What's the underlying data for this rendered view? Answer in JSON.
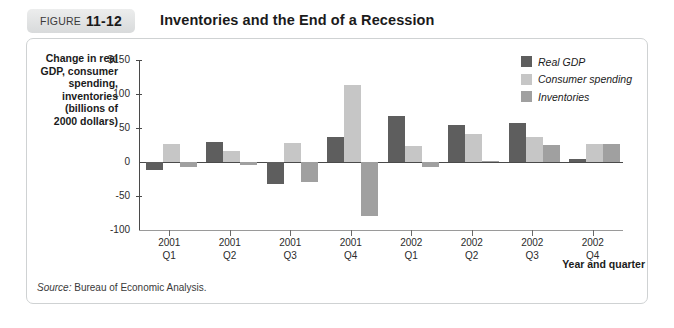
{
  "figure": {
    "tab_word": "FIGURE",
    "tab_number": "11-12",
    "title": "Inventories and the End of a Recession",
    "source_label": "Source:",
    "source_text": " Bureau of Economic Analysis."
  },
  "legend": {
    "items": [
      {
        "label": "Real GDP",
        "color": "#5e5e5e"
      },
      {
        "label": "Consumer spending",
        "color": "#c6c6c6"
      },
      {
        "label": "Inventories",
        "color": "#a0a0a0"
      }
    ]
  },
  "axes": {
    "y_caption": "Change in real GDP, consumer spending, inventories (billions of 2000 dollars)",
    "y_caption_lines": [
      "Change in real",
      "GDP, consumer",
      "spending,",
      "inventories",
      "(billions of",
      "2000 dollars)"
    ],
    "y_ticks": [
      "$150",
      "100",
      "50",
      "0",
      "-50",
      "-100"
    ],
    "x_title": "Year and quarter"
  },
  "chart_data": {
    "type": "bar",
    "title": "Inventories and the End of a Recession",
    "xlabel": "Year and quarter",
    "ylabel": "Change in real GDP, consumer spending, inventories (billions of 2000 dollars)",
    "ylim": [
      -100,
      150
    ],
    "ytick_values": [
      150,
      100,
      50,
      0,
      -50,
      -100
    ],
    "grid": false,
    "legend_position": "top-right",
    "categories": [
      "2001 Q1",
      "2001 Q2",
      "2001 Q3",
      "2001 Q4",
      "2002 Q1",
      "2002 Q2",
      "2002 Q3",
      "2002 Q4"
    ],
    "category_lines": [
      [
        "2001",
        "Q1"
      ],
      [
        "2001",
        "Q2"
      ],
      [
        "2001",
        "Q3"
      ],
      [
        "2001",
        "Q4"
      ],
      [
        "2002",
        "Q1"
      ],
      [
        "2002",
        "Q2"
      ],
      [
        "2002",
        "Q3"
      ],
      [
        "2002",
        "Q4"
      ]
    ],
    "series": [
      {
        "name": "Real GDP",
        "color": "#5e5e5e",
        "values": [
          -12,
          29,
          -32,
          37,
          67,
          54,
          58,
          5
        ]
      },
      {
        "name": "Consumer spending",
        "color": "#c6c6c6",
        "values": [
          27,
          16,
          28,
          113,
          23,
          41,
          37,
          26
        ]
      },
      {
        "name": "Inventories",
        "color": "#a0a0a0",
        "values": [
          -8,
          -5,
          -30,
          -80,
          -7,
          2,
          25,
          26
        ]
      }
    ]
  }
}
